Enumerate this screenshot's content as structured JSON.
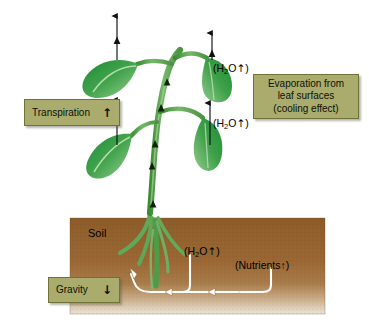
{
  "diagram": {
    "type": "labelled-biology-diagram",
    "background_color": "#ffffff",
    "width": 369,
    "height": 331
  },
  "callouts": [
    {
      "id": "transpiration",
      "label": "Transpiration",
      "arrow": "↑",
      "arrow_direction": "up",
      "box_color": "#a9ac6c",
      "border_color": "#6f7338"
    },
    {
      "id": "evaporation",
      "line1": "Evaporation from",
      "line2": "leaf surfaces",
      "line3": "(cooling effect)",
      "box_color": "#a9ac6c",
      "border_color": "#6f7338"
    },
    {
      "id": "gravity",
      "label": "Gravity",
      "arrow": "↓",
      "arrow_direction": "down",
      "box_color": "#a9ac6c",
      "border_color": "#6f7338"
    }
  ],
  "labels": {
    "h2o_top": {
      "open": "(H",
      "sub": "2",
      "rest": "O",
      "arrow": "↑",
      "close": ")"
    },
    "h2o_mid": {
      "open": "(H",
      "sub": "2",
      "rest": "O",
      "arrow": "↑",
      "close": ")"
    },
    "h2o_soil": {
      "open": "(H",
      "sub": "2",
      "rest": "O",
      "arrow": "↑",
      "close": ")"
    },
    "nutrients": {
      "text": "(Nutrients↑)"
    },
    "soil": {
      "text": "Soil"
    }
  },
  "soil_block": {
    "name": "soil",
    "top_color": "#8a5a28",
    "mid_color": "#9c6a33",
    "bottom_color": "#e6ddcd",
    "x": 70,
    "y": 218,
    "width": 255,
    "height": 96
  },
  "plant": {
    "stem_color_dark": "#3f8a34",
    "stem_color_light": "#86c078",
    "leaf_color_dark": "#1f8a37",
    "leaf_color_mid": "#3fa14a",
    "leaf_color_light": "#8fc98a",
    "root_color": "#5fa35a",
    "leaf_count": 4,
    "xylem_arrow_count": 4
  },
  "transpiration_arrows": {
    "color": "#111111",
    "count": 4,
    "direction": "up",
    "description": "vertical arrows rising from each leaf"
  },
  "soil_arrows": {
    "color": "#ffffff",
    "outline_color": "#6b4a22",
    "description": "white curved uptake arrows from soil into root"
  }
}
